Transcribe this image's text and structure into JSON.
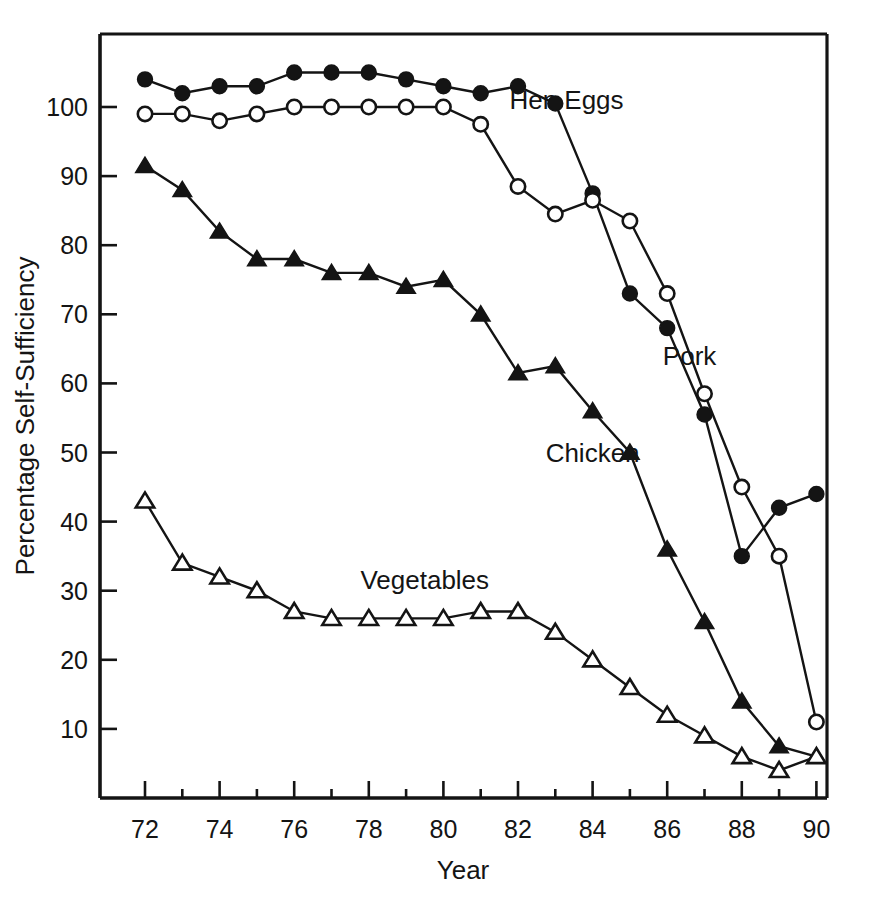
{
  "chart_data": {
    "type": "line",
    "title": "",
    "xlabel": "Year",
    "ylabel": "Percentage Self-Sufficiency",
    "xlim": [
      71.2,
      90.7
    ],
    "ylim": [
      0,
      108
    ],
    "grid": false,
    "legend": "inline-labels",
    "x": [
      72,
      73,
      74,
      75,
      76,
      77,
      78,
      79,
      80,
      81,
      82,
      83,
      84,
      85,
      86,
      87,
      88,
      89,
      90
    ],
    "xticks_major": [
      72,
      74,
      76,
      78,
      80,
      82,
      84,
      86,
      88,
      90
    ],
    "xticks_minor": [
      73,
      75,
      77,
      79,
      81,
      83,
      85,
      87,
      89
    ],
    "yticks": [
      10,
      20,
      30,
      40,
      50,
      60,
      70,
      80,
      90,
      100
    ],
    "series": [
      {
        "name": "Hen Eggs",
        "marker": "filled-circle",
        "label_x": 83.3,
        "label_y": 101,
        "values": [
          104,
          102,
          103,
          103,
          105,
          105,
          105,
          104,
          103,
          102,
          103,
          100.5,
          87.5,
          73,
          68,
          55.5,
          35,
          42,
          44
        ]
      },
      {
        "name": "Pork",
        "marker": "open-circle",
        "label_x": 86.6,
        "label_y": 64,
        "values": [
          99,
          99,
          98,
          99,
          100,
          100,
          100,
          100,
          100,
          97.5,
          88.5,
          84.5,
          86.5,
          83.5,
          73,
          58.5,
          45,
          35,
          11
        ]
      },
      {
        "name": "Chicken",
        "marker": "filled-triangle",
        "label_x": 84.0,
        "label_y": 50,
        "values": [
          91.5,
          88,
          82,
          78,
          78,
          76,
          76,
          74,
          75,
          70,
          61.5,
          62.5,
          56,
          50,
          36,
          25.5,
          14,
          7.5,
          6
        ]
      },
      {
        "name": "Vegetables",
        "marker": "open-triangle",
        "label_x": 79.5,
        "label_y": 31.5,
        "values": [
          43,
          34,
          32,
          30,
          27,
          26,
          26,
          26,
          26,
          27,
          27,
          24,
          20,
          16,
          12,
          9,
          6,
          4,
          6
        ]
      }
    ]
  },
  "axes": {
    "xlabel": "Year",
    "ylabel": "Percentage Self-Sufficiency",
    "xtick_labels": [
      "72",
      "74",
      "76",
      "78",
      "80",
      "82",
      "84",
      "86",
      "88",
      "90"
    ],
    "ytick_labels": [
      "10",
      "20",
      "30",
      "40",
      "50",
      "60",
      "70",
      "80",
      "90",
      "100"
    ]
  },
  "annotations": {
    "hen_eggs": "Hen Eggs",
    "pork": "Pork",
    "chicken": "Chicken",
    "vegetables": "Vegetables"
  },
  "colors": {
    "ink": "#141414",
    "background": "#ffffff"
  }
}
